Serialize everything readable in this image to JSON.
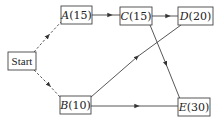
{
  "diagram": {
    "type": "activity-network",
    "colors": {
      "line": "#444444",
      "text": "#222222",
      "background": "#ffffff"
    },
    "nodes": {
      "start": {
        "id": "Start",
        "label": "Start"
      },
      "a": {
        "id": "A",
        "name": "A",
        "duration": "(15)"
      },
      "b": {
        "id": "B",
        "name": "B",
        "duration": "(10)"
      },
      "c": {
        "id": "C",
        "name": "C",
        "duration": "(15)"
      },
      "d": {
        "id": "D",
        "name": "D",
        "duration": "(20)"
      },
      "e": {
        "id": "E",
        "name": "E",
        "duration": "(30)"
      }
    },
    "edges": [
      {
        "from": "Start",
        "to": "A",
        "style": "dashed"
      },
      {
        "from": "Start",
        "to": "B",
        "style": "dashed"
      },
      {
        "from": "A",
        "to": "C",
        "style": "solid"
      },
      {
        "from": "C",
        "to": "D",
        "style": "solid"
      },
      {
        "from": "C",
        "to": "E",
        "style": "solid"
      },
      {
        "from": "B",
        "to": "D",
        "style": "solid"
      },
      {
        "from": "B",
        "to": "E",
        "style": "solid"
      }
    ]
  }
}
